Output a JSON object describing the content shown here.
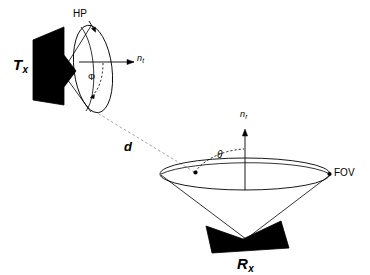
{
  "figure": {
    "background_color": "#ffffff",
    "line_color": "#000000",
    "fill_color": "#000000",
    "dashed_color": "#999999"
  },
  "labels": {
    "tx": {
      "base": "T",
      "sub": "x",
      "meaning": "transmitter"
    },
    "rx": {
      "base": "R",
      "sub": "x",
      "meaning": "receiver"
    },
    "hp": {
      "text": "HP",
      "meaning": "half-power point"
    },
    "fov": {
      "text": "FOV",
      "meaning": "field of view"
    },
    "normal_tx": {
      "base": "n",
      "sub": "t",
      "meaning": "transmitter normal vector"
    },
    "normal_rx": {
      "base": "n",
      "sub": "r",
      "meaning": "receiver normal vector"
    },
    "distance": {
      "text": "d",
      "meaning": "link distance between transmitter and receiver"
    },
    "irradiance_angle": {
      "text": "Φ",
      "meaning": "irradiance angle / half-power semi-angle"
    },
    "incidence_angle": {
      "text": "θ",
      "meaning": "angle of incidence at receiver"
    }
  }
}
